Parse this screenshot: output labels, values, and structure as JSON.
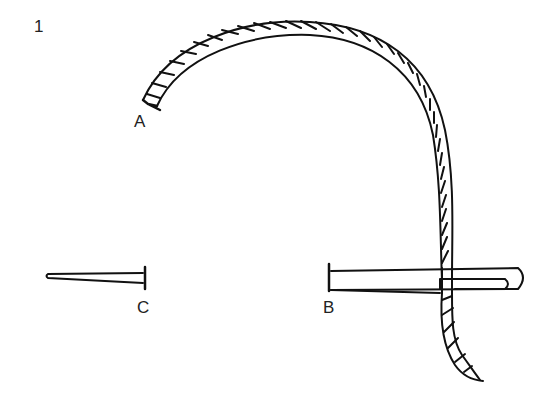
{
  "figure": {
    "number": "1",
    "labels": {
      "a": "A",
      "b": "B",
      "c": "C"
    },
    "parts": [
      {
        "id": "thread",
        "description": "twisted thread forming a large arc from point A, passing through the eye of the needle at B"
      },
      {
        "id": "needle-b",
        "description": "needle with thread through its eye"
      },
      {
        "id": "pin-c",
        "description": "small pin / short needle"
      }
    ],
    "colors": {
      "stroke": "#111111",
      "background": "#ffffff"
    }
  }
}
